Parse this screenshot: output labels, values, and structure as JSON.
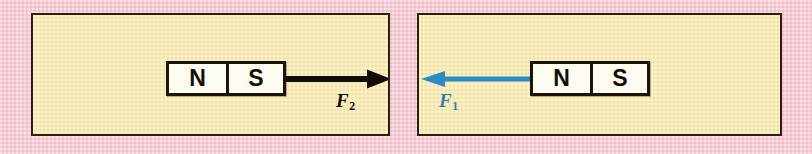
{
  "figure": {
    "background_color": "#f6ccd5",
    "panel_fill_color": "#f7eab5",
    "panel_border_color": "#2b1f12"
  },
  "panels": [
    {
      "id": "left",
      "magnet": {
        "poles": [
          {
            "label": "N"
          },
          {
            "label": "S"
          }
        ]
      },
      "arrow": {
        "direction": "right",
        "color": "#130d07",
        "color_name": "black"
      },
      "force": {
        "symbol": "F",
        "subscript": "2",
        "full": "F2",
        "color": "#130d07"
      }
    },
    {
      "id": "right",
      "magnet": {
        "poles": [
          {
            "label": "N"
          },
          {
            "label": "S"
          }
        ]
      },
      "arrow": {
        "direction": "left",
        "color": "#2b8cc4",
        "color_name": "blue"
      },
      "force": {
        "symbol": "F",
        "subscript": "1",
        "full": "F1",
        "color": "#2f7fae"
      }
    }
  ]
}
